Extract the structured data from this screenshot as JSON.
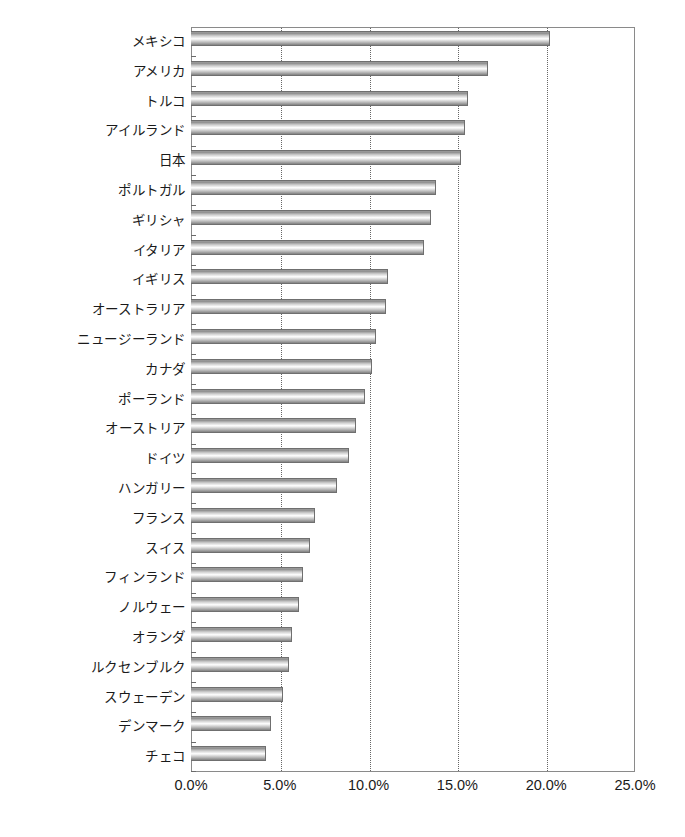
{
  "chart_data": {
    "type": "bar",
    "orientation": "horizontal",
    "title": "",
    "subtitle": "",
    "xlabel": "",
    "ylabel": "",
    "xlim": [
      0,
      25
    ],
    "xtick_labels": [
      "0.0%",
      "5.0%",
      "10.0%",
      "15.0%",
      "20.0%",
      "25.0%"
    ],
    "xtick_values": [
      0,
      5,
      10,
      15,
      20,
      25
    ],
    "grid": "vertical-dotted",
    "legend": "none",
    "unit": "%",
    "categories": [
      "メキシコ",
      "アメリカ",
      "トルコ",
      "アイルランド",
      "日本",
      "ポルトガル",
      "ギリシャ",
      "イタリア",
      "イギリス",
      "オーストラリア",
      "ニュージーランド",
      "カナダ",
      "ポーランド",
      "オーストリア",
      "ドイツ",
      "ハンガリー",
      "フランス",
      "スイス",
      "フィンランド",
      "ノルウェー",
      "オランダ",
      "ルクセンブルク",
      "スウェーデン",
      "デンマーク",
      "チェコ"
    ],
    "values": [
      20.2,
      16.7,
      15.6,
      15.4,
      15.2,
      13.8,
      13.5,
      13.1,
      11.1,
      11.0,
      10.4,
      10.2,
      9.8,
      9.3,
      8.9,
      8.2,
      7.0,
      6.7,
      6.3,
      6.1,
      5.7,
      5.5,
      5.2,
      4.5,
      4.2
    ]
  },
  "colors": {
    "bar_edge": "#6f6f6f",
    "bar_fill_light": "#ffffff",
    "bar_fill_dark": "#8c8c8c",
    "plot_border": "#8a8a8a",
    "gridline": "#666666",
    "text": "#1a1a1a",
    "background": "#ffffff"
  }
}
